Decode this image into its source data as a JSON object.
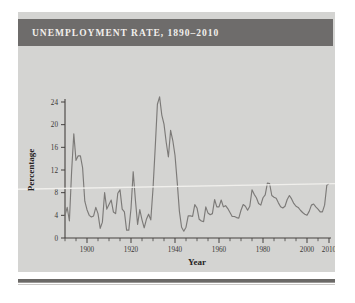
{
  "figure": {
    "title": "UNEMPLOYMENT RATE, 1890–2010",
    "title_bar_color": "#6e6c6b",
    "panel_color": "#d4d4d2",
    "line_color": "#7c7a78",
    "axis_color": "#44413f"
  },
  "chart_data": {
    "type": "line",
    "title": "UNEMPLOYMENT RATE, 1890–2010",
    "xlabel": "Year",
    "ylabel": "Percentage",
    "xlim": [
      1890,
      2010
    ],
    "ylim": [
      0,
      24
    ],
    "grid": false,
    "legend": "none",
    "x_ticks": [
      1900,
      1920,
      1940,
      1960,
      1980,
      2000,
      2010
    ],
    "x_tick_labels": [
      "1900",
      "1920",
      "1940",
      "1960",
      "1980",
      "2000",
      "2010"
    ],
    "x_minor_tick_step": 5,
    "y_ticks": [
      0,
      4,
      8,
      12,
      16,
      20,
      24
    ],
    "y_tick_labels": [
      "0",
      "4",
      "8",
      "12",
      "16",
      "20",
      "24"
    ],
    "series": [
      {
        "name": "Unemployment rate",
        "x": [
          1890,
          1891,
          1892,
          1893,
          1894,
          1895,
          1896,
          1897,
          1898,
          1899,
          1900,
          1901,
          1902,
          1903,
          1904,
          1905,
          1906,
          1907,
          1908,
          1909,
          1910,
          1911,
          1912,
          1913,
          1914,
          1915,
          1916,
          1917,
          1918,
          1919,
          1920,
          1921,
          1922,
          1923,
          1924,
          1925,
          1926,
          1927,
          1928,
          1929,
          1930,
          1931,
          1932,
          1933,
          1934,
          1935,
          1936,
          1937,
          1938,
          1939,
          1940,
          1941,
          1942,
          1943,
          1944,
          1945,
          1946,
          1947,
          1948,
          1949,
          1950,
          1951,
          1952,
          1953,
          1954,
          1955,
          1956,
          1957,
          1958,
          1959,
          1960,
          1961,
          1962,
          1963,
          1964,
          1965,
          1966,
          1967,
          1968,
          1969,
          1970,
          1971,
          1972,
          1973,
          1974,
          1975,
          1976,
          1977,
          1978,
          1979,
          1980,
          1981,
          1982,
          1983,
          1984,
          1985,
          1986,
          1987,
          1988,
          1989,
          1990,
          1991,
          1992,
          1993,
          1994,
          1995,
          1996,
          1997,
          1998,
          1999,
          2000,
          2001,
          2002,
          2003,
          2004,
          2005,
          2006,
          2007,
          2008,
          2009,
          2010
        ],
        "values": [
          4.0,
          5.4,
          3.0,
          11.7,
          18.4,
          13.7,
          14.5,
          14.5,
          12.4,
          6.5,
          5.0,
          4.0,
          3.7,
          3.9,
          5.4,
          4.3,
          1.7,
          2.8,
          8.0,
          5.1,
          5.9,
          6.7,
          4.6,
          4.3,
          7.9,
          8.5,
          5.1,
          4.6,
          1.4,
          1.4,
          5.2,
          11.7,
          6.7,
          2.4,
          5.0,
          3.2,
          1.8,
          3.3,
          4.2,
          3.2,
          8.7,
          15.9,
          23.6,
          24.9,
          21.7,
          20.1,
          16.9,
          14.3,
          19.0,
          17.2,
          14.6,
          9.9,
          4.7,
          1.9,
          1.2,
          1.9,
          3.9,
          3.9,
          3.8,
          5.9,
          5.3,
          3.3,
          3.0,
          2.9,
          5.5,
          4.4,
          4.1,
          4.3,
          6.8,
          5.5,
          5.5,
          6.7,
          5.5,
          5.7,
          5.2,
          4.5,
          3.8,
          3.8,
          3.6,
          3.5,
          4.9,
          5.9,
          5.6,
          4.9,
          5.6,
          8.5,
          7.7,
          7.1,
          6.1,
          5.8,
          7.1,
          7.6,
          9.7,
          9.6,
          7.5,
          7.2,
          7.0,
          6.2,
          5.5,
          5.3,
          5.6,
          6.8,
          7.5,
          6.9,
          6.1,
          5.6,
          5.4,
          4.9,
          4.5,
          4.2,
          4.0,
          4.7,
          5.8,
          6.0,
          5.5,
          5.1,
          4.6,
          4.6,
          5.8,
          9.3,
          9.6
        ]
      }
    ]
  }
}
